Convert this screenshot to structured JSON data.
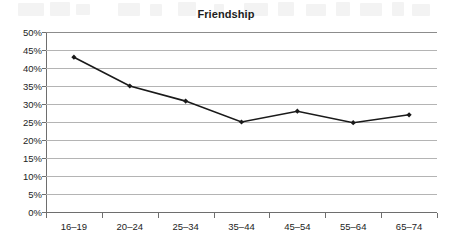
{
  "chart_data": {
    "type": "line",
    "title": "Friendship",
    "xlabel": "",
    "ylabel": "",
    "categories": [
      "16–19",
      "20–24",
      "25–34",
      "35–44",
      "45–54",
      "55–64",
      "65–74"
    ],
    "values": [
      43,
      35,
      30.8,
      25,
      28,
      24.8,
      27
    ],
    "series": [
      {
        "name": "Friendship",
        "values": [
          43,
          35,
          30.8,
          25,
          28,
          24.8,
          27
        ]
      }
    ],
    "ylim": [
      0,
      50
    ],
    "ytick_labels": [
      "0%",
      "5%",
      "10%",
      "15%",
      "20%",
      "25%",
      "30%",
      "35%",
      "40%",
      "45%",
      "50%"
    ],
    "ytick_values": [
      0,
      5,
      10,
      15,
      20,
      25,
      30,
      35,
      40,
      45,
      50
    ],
    "grid": true,
    "legend": false,
    "legend_position": "none",
    "line_color": "#1a1a1a",
    "marker_color": "#1a1a1a",
    "gridline_color": "#b4b4b4",
    "axis_color": "#6e6e6e",
    "background_color": "#ffffff"
  }
}
